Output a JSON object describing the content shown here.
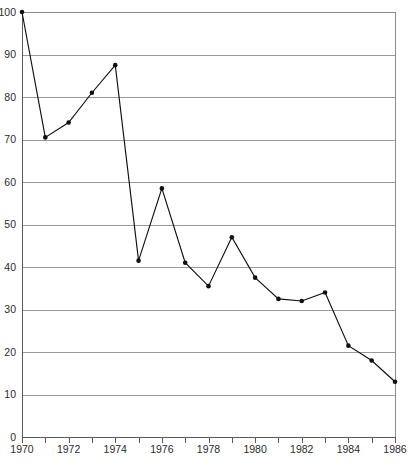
{
  "chart_data": {
    "type": "line",
    "title": "",
    "subtitle": "",
    "xlabel": "",
    "ylabel": "",
    "xlim": [
      1970,
      1986
    ],
    "ylim": [
      0,
      100
    ],
    "grid": true,
    "legend": null,
    "legend_position": "none",
    "x": [
      1970,
      1971,
      1972,
      1973,
      1974,
      1975,
      1976,
      1977,
      1978,
      1979,
      1980,
      1981,
      1982,
      1983,
      1984,
      1985,
      1986
    ],
    "values": [
      100,
      70.5,
      74,
      81,
      87.5,
      41.5,
      58.5,
      41,
      35.5,
      47,
      37.5,
      32.5,
      32,
      34,
      21.5,
      18,
      13
    ],
    "series": [
      {
        "name": "series-1",
        "color": "#101010",
        "values": [
          100,
          70.5,
          74,
          81,
          87.5,
          41.5,
          58.5,
          41,
          35.5,
          47,
          37.5,
          32.5,
          32,
          34,
          21.5,
          18,
          13
        ]
      }
    ],
    "x_tick_labels": [
      "1970",
      "1972",
      "1974",
      "1976",
      "1978",
      "1980",
      "1982",
      "1984",
      "1986"
    ],
    "x_tick_values": [
      1970,
      1972,
      1974,
      1976,
      1978,
      1980,
      1982,
      1984,
      1986
    ],
    "x_minor_tick_values": [
      1971,
      1973,
      1975,
      1977,
      1979,
      1981,
      1983,
      1985
    ],
    "y_tick_labels": [
      "0",
      "10",
      "20",
      "30",
      "40",
      "50",
      "60",
      "70",
      "80",
      "90",
      "100"
    ],
    "y_tick_values": [
      0,
      10,
      20,
      30,
      40,
      50,
      60,
      70,
      80,
      90,
      100
    ],
    "colors": {
      "line": "#101010",
      "marker": "#101010",
      "grid": "#9a9a9a",
      "axis": "#5a5a5a",
      "text": "#2b2b2b",
      "background": "#ffffff"
    }
  }
}
